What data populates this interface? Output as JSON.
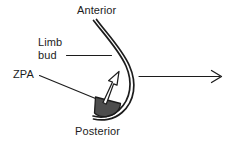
{
  "figure": {
    "width": 231,
    "height": 143,
    "background_color": "#ffffff",
    "stroke_color": "#1c1c1c",
    "zpa_fill_color": "#4d4d4d"
  },
  "labels": {
    "anterior": "Anterior",
    "posterior": "Posterior",
    "limb_bud_line1": "Limb",
    "limb_bud_line2": "bud",
    "zpa": "ZPA"
  },
  "annotations": {
    "limb_bud_leader": "leader-line",
    "zpa_leader": "leader-line",
    "zpa_signal_arrow": "arrow-up-right",
    "growth_arrow": "arrow-right"
  }
}
